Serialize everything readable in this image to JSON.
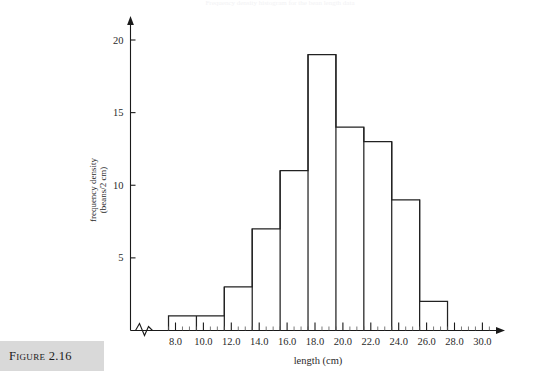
{
  "figure": {
    "caption_label": "Figure 2.16",
    "top_caption": "Frequency density histogram for the bean length data"
  },
  "chart_data": {
    "type": "bar",
    "title": "",
    "xlabel": "length (cm)",
    "ylabel": "frequency density\n(beans/2 cm)",
    "ylabel_line1": "frequency density",
    "ylabel_line2": "(beans/2 cm)",
    "xlim": [
      7.5,
      30.5
    ],
    "ylim": [
      0,
      21
    ],
    "grid": false,
    "legend": "none",
    "axis_break": true,
    "bin_width": 2,
    "bin_edges": [
      7.5,
      9.5,
      11.5,
      13.5,
      15.5,
      17.5,
      19.5,
      21.5,
      23.5,
      25.5,
      27.5
    ],
    "categories": [
      "7.5-9.5",
      "9.5-11.5",
      "11.5-13.5",
      "13.5-15.5",
      "15.5-17.5",
      "17.5-19.5",
      "19.5-21.5",
      "21.5-23.5",
      "23.5-25.5",
      "25.5-27.5"
    ],
    "values": [
      1,
      1,
      3,
      7,
      11,
      19,
      14,
      13,
      9,
      2
    ],
    "x_ticks": [
      8.0,
      10.0,
      12.0,
      14.0,
      16.0,
      18.0,
      20.0,
      22.0,
      24.0,
      26.0,
      28.0,
      30.0
    ],
    "x_tick_labels": [
      "8.0",
      "10.0",
      "12.0",
      "14.0",
      "16.0",
      "18.0",
      "20.0",
      "22.0",
      "24.0",
      "26.0",
      "28.0",
      "30.0"
    ],
    "x_minor_step": 0.5,
    "y_ticks": [
      5,
      10,
      15,
      20
    ],
    "y_tick_labels": [
      "5",
      "10",
      "15",
      "20"
    ],
    "colors": {
      "bar_stroke": "#222222",
      "bar_fill": "none",
      "axis": "#1a1a1a",
      "text": "#2a2a2a",
      "caption_band": "#d9d9d9"
    }
  }
}
